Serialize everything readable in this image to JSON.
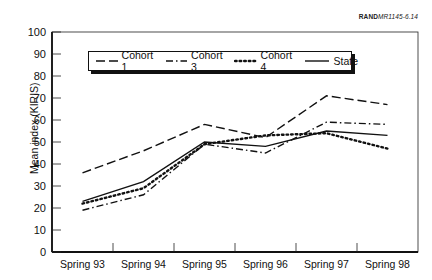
{
  "figure_ref": {
    "prefix": "RAND",
    "suffix": "MR1145-6.14"
  },
  "chart_data": {
    "type": "line",
    "title": "",
    "xlabel": "",
    "ylabel": "Mean index (KIRIS)",
    "ylim": [
      0,
      100
    ],
    "yticks": [
      0,
      10,
      20,
      30,
      40,
      50,
      60,
      70,
      80,
      90,
      100
    ],
    "categories": [
      "Spring 93",
      "Spring 94",
      "Spring 95",
      "Spring 96",
      "Spring 97",
      "Spring 98"
    ],
    "grid": false,
    "legend_position": "top-inside",
    "series": [
      {
        "name": "Cohort 1",
        "style": "long-dash",
        "values": [
          36,
          46,
          58,
          52,
          71,
          67
        ]
      },
      {
        "name": "Cohort 3",
        "style": "dash-dot",
        "values": [
          19,
          26,
          49,
          45,
          59,
          58
        ]
      },
      {
        "name": "Cohort 4",
        "style": "dotted",
        "values": [
          22,
          29,
          49,
          53,
          54,
          47
        ]
      },
      {
        "name": "State",
        "style": "solid",
        "values": [
          23,
          32,
          50,
          48,
          55,
          53
        ]
      }
    ]
  }
}
